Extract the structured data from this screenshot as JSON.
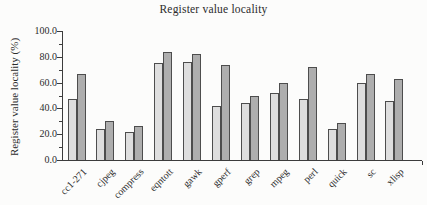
{
  "figure": {
    "title": "Register value locality"
  },
  "y_axis": {
    "label": "Register value locality (%)",
    "ticks": [
      {
        "v": 0,
        "label": "0.0"
      },
      {
        "v": 20,
        "label": "20.0"
      },
      {
        "v": 40,
        "label": "40.0"
      },
      {
        "v": 60,
        "label": "60.0"
      },
      {
        "v": 80,
        "label": "80.0"
      },
      {
        "v": 100,
        "label": "100.0"
      }
    ],
    "minor_ticks": [
      10,
      30,
      50,
      70,
      90
    ]
  },
  "chart_data": {
    "type": "bar",
    "title": "Register value locality",
    "xlabel": "",
    "ylabel": "Register value locality (%)",
    "ylim": [
      0,
      100
    ],
    "grid": false,
    "legend": "none",
    "categories": [
      "cc1-271",
      "cjpeg",
      "compress",
      "eqntott",
      "gawk",
      "gperf",
      "grep",
      "mpeg",
      "perl",
      "quick",
      "sc",
      "xlisp"
    ],
    "series": [
      {
        "name": "light-bar",
        "color": "#dedede",
        "values": [
          47,
          24,
          22,
          75,
          76,
          42,
          44,
          52,
          47,
          24,
          60,
          46
        ]
      },
      {
        "name": "dark-bar",
        "color": "#aeaeae",
        "values": [
          67,
          30,
          26,
          84,
          82,
          74,
          50,
          60,
          72,
          29,
          67,
          63
        ]
      }
    ]
  }
}
